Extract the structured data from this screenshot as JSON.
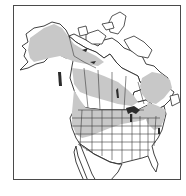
{
  "map": {
    "title": "",
    "region": "North America",
    "countries_shown": [
      "Canada",
      "United States",
      "Mexico (northern)"
    ],
    "legend": [],
    "colors": {
      "frame": "#4a4a4a",
      "land": "#ffffff",
      "outline": "#2b2b2b",
      "range_shading": "#c8c8c8",
      "background": "#ffffff"
    },
    "range_areas": [
      "Alaska interior",
      "Yukon and western Northwest Territories",
      "Northern Canadian boreal band",
      "Western Canada provinces (BC, AB, SK, MB)",
      "Northern and western United States",
      "Quebec / Labrador interior",
      "Northeastern United States and Maritimes"
    ]
  }
}
